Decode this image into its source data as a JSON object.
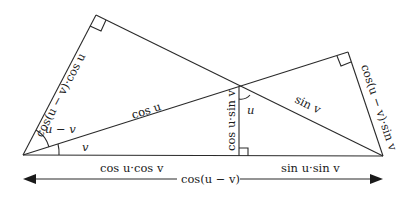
{
  "diagram": {
    "labels": {
      "left_side": "cos(u − v)·cos u",
      "right_side": "cos(u − v)·sin v",
      "hypotenuse_cos_u": "cos u",
      "hypotenuse_sin_v": "sin v",
      "vertical": "cos u·sin v",
      "angle_u_minus_v": "u − v",
      "angle_v": "v",
      "angle_u": "u",
      "base_left": "cos u·cos v",
      "base_right": "sin u·sin v",
      "total": "cos(u − v)"
    },
    "colors": {
      "stroke": "#2a2a2a",
      "text": "#1a1a1a",
      "background": "#ffffff"
    }
  }
}
